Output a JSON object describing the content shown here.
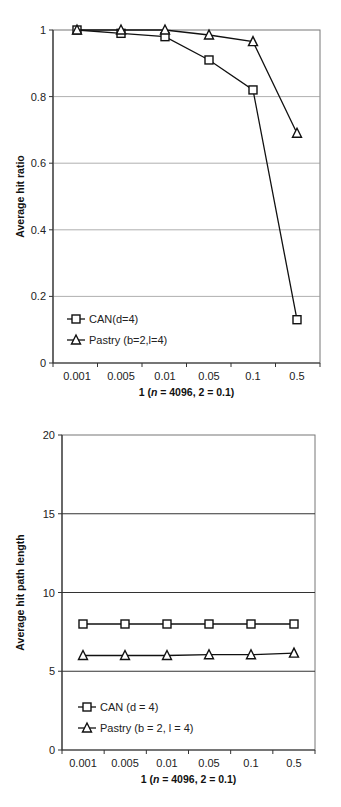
{
  "chart_data": [
    {
      "type": "line",
      "categories": [
        "0.001",
        "0.005",
        "0.01",
        "0.05",
        "0.1",
        "0.5"
      ],
      "series": [
        {
          "name": "CAN(d=4)",
          "marker": "square",
          "values": [
            1.0,
            0.99,
            0.98,
            0.91,
            0.82,
            0.13
          ]
        },
        {
          "name": "Pastry (b=2,l=4)",
          "marker": "triangle",
          "values": [
            1.0,
            1.0,
            1.0,
            0.985,
            0.965,
            0.69
          ]
        }
      ],
      "title": "",
      "xlabel": "1 (n = 4096, 2 = 0.1)",
      "ylabel": "Average hit ratio",
      "ylim": [
        0,
        1
      ],
      "yticks": [
        "0",
        "0.2",
        "0.4",
        "0.6",
        "0.8",
        "1"
      ],
      "grid": true,
      "legend_position": "lower left"
    },
    {
      "type": "line",
      "categories": [
        "0.001",
        "0.005",
        "0.01",
        "0.05",
        "0.1",
        "0.5"
      ],
      "series": [
        {
          "name": "CAN (d = 4)",
          "marker": "square",
          "values": [
            8.0,
            8.0,
            8.0,
            8.0,
            8.0,
            8.0
          ]
        },
        {
          "name": "Pastry (b = 2, l = 4)",
          "marker": "triangle",
          "values": [
            6.0,
            6.0,
            6.0,
            6.05,
            6.05,
            6.15
          ]
        }
      ],
      "title": "",
      "xlabel": "1 (n = 4096, 2 = 0.1)",
      "ylabel": "Average hit path length",
      "ylim": [
        0,
        20
      ],
      "yticks": [
        "0",
        "5",
        "10",
        "15",
        "20"
      ],
      "grid": true,
      "legend_position": "lower left"
    }
  ],
  "chart1": {
    "ylabel": "Average hit ratio",
    "xlabel_prefix": "1 (",
    "xlabel_n": "n",
    "xlabel_suffix": " = 4096, 2 = 0.1)",
    "legend": [
      "CAN(d=4)",
      "Pastry (b=2,l=4)"
    ]
  },
  "chart2": {
    "ylabel": "Average hit path length",
    "xlabel_prefix": "1 (",
    "xlabel_n": "n",
    "xlabel_suffix": " = 4096, 2 = 0.1)",
    "legend": [
      "CAN (d = 4)",
      "Pastry (b = 2, l = 4)"
    ]
  }
}
